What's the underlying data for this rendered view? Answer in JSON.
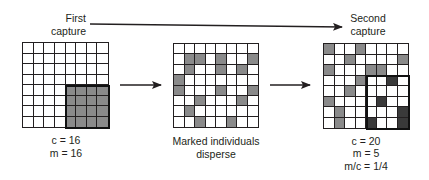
{
  "labels": {
    "first_capture_line1": "First",
    "first_capture_line2": "capture",
    "second_capture_line1": "Second",
    "second_capture_line2": "capture",
    "disperse_line1": "Marked individuals",
    "disperse_line2": "disperse"
  },
  "first_grid": {
    "c": "c = 16",
    "m": "m = 16",
    "marked_block": {
      "row_start": 4,
      "col_start": 4,
      "rows": 4,
      "cols": 4
    }
  },
  "middle_grid": {
    "gray_cells": [
      [
        1,
        1
      ],
      [
        1,
        2
      ],
      [
        1,
        4
      ],
      [
        1,
        7
      ],
      [
        2,
        1
      ],
      [
        2,
        4
      ],
      [
        2,
        6
      ],
      [
        3,
        0
      ],
      [
        4,
        0
      ],
      [
        4,
        4
      ],
      [
        4,
        7
      ],
      [
        5,
        2
      ],
      [
        5,
        6
      ],
      [
        6,
        1
      ],
      [
        7,
        2
      ],
      [
        7,
        5
      ]
    ]
  },
  "second_grid": {
    "c": "c = 20",
    "m": "m = 5",
    "ratio": "m/c = 1/4",
    "gray_cells": [
      [
        0,
        0
      ],
      [
        0,
        3
      ],
      [
        1,
        2
      ],
      [
        1,
        7
      ],
      [
        2,
        0
      ],
      [
        2,
        4
      ],
      [
        2,
        5
      ],
      [
        3,
        3
      ],
      [
        4,
        2
      ],
      [
        5,
        0
      ],
      [
        6,
        1
      ],
      [
        7,
        1
      ]
    ],
    "dark_cells": [
      [
        3,
        6
      ],
      [
        5,
        5
      ],
      [
        6,
        7
      ],
      [
        7,
        4
      ],
      [
        7,
        7
      ]
    ],
    "capture_block": {
      "row_start": 3,
      "col_start": 4,
      "rows": 5,
      "cols": 4
    }
  },
  "colors": {
    "line": "#231f20",
    "gray": "#8a8a8a",
    "dark": "#3a3a3a"
  }
}
